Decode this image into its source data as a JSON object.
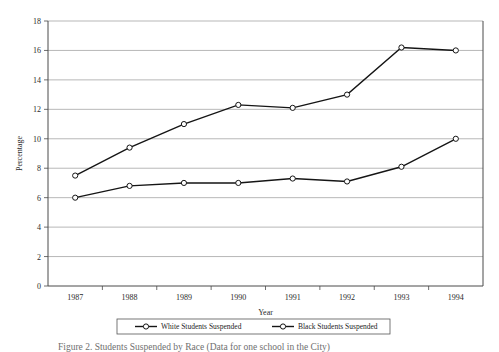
{
  "figure": {
    "caption": "Figure 2. Students Suspended by Race (Data for one school in the City)"
  },
  "chart_data": {
    "type": "line",
    "title": "",
    "xlabel": "Year",
    "ylabel": "Percentage",
    "categories": [
      "1987",
      "1988",
      "1989",
      "1990",
      "1991",
      "1992",
      "1993",
      "1994"
    ],
    "ylim": [
      0,
      18
    ],
    "ytick_step": 2,
    "yticks": [
      "0",
      "2",
      "4",
      "6",
      "8",
      "10",
      "12",
      "14",
      "16",
      "18"
    ],
    "grid": true,
    "legend_position": "bottom",
    "series": [
      {
        "name": "White Students Suspended",
        "marker": "open-circle",
        "color": "#151515",
        "values": [
          6.0,
          6.8,
          7.0,
          7.0,
          7.3,
          7.1,
          8.1,
          10.0
        ]
      },
      {
        "name": "Black Students Suspended",
        "marker": "open-circle",
        "color": "#151515",
        "values": [
          7.5,
          9.4,
          11.0,
          12.3,
          12.1,
          13.0,
          16.2,
          16.0
        ]
      }
    ]
  },
  "legend": {
    "entries": [
      {
        "label": "White Students Suspended"
      },
      {
        "label": "Black Students Suspended"
      }
    ]
  }
}
